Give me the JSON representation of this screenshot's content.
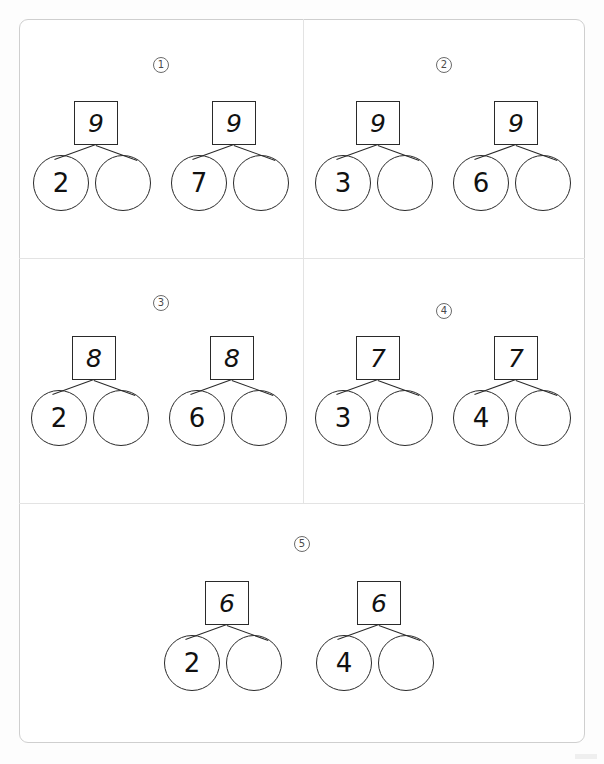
{
  "worksheet": {
    "title": "Number Bonds Worksheet",
    "panels": [
      {
        "number": "1",
        "bonds": [
          {
            "whole": "9",
            "part_left": "2",
            "part_right": ""
          },
          {
            "whole": "9",
            "part_left": "7",
            "part_right": ""
          }
        ]
      },
      {
        "number": "2",
        "bonds": [
          {
            "whole": "9",
            "part_left": "3",
            "part_right": ""
          },
          {
            "whole": "9",
            "part_left": "6",
            "part_right": ""
          }
        ]
      },
      {
        "number": "3",
        "bonds": [
          {
            "whole": "8",
            "part_left": "2",
            "part_right": ""
          },
          {
            "whole": "8",
            "part_left": "6",
            "part_right": ""
          }
        ]
      },
      {
        "number": "4",
        "bonds": [
          {
            "whole": "7",
            "part_left": "3",
            "part_right": ""
          },
          {
            "whole": "7",
            "part_left": "4",
            "part_right": ""
          }
        ]
      },
      {
        "number": "5",
        "bonds": [
          {
            "whole": "6",
            "part_left": "2",
            "part_right": ""
          },
          {
            "whole": "6",
            "part_left": "4",
            "part_right": ""
          }
        ]
      }
    ]
  },
  "colors": {
    "page_background": "#ffffff",
    "frame_border": "#cfcfcf",
    "divider": "#e3e3e3",
    "ink": "#2a2a2a",
    "marker_ink": "#4a4a4a"
  }
}
